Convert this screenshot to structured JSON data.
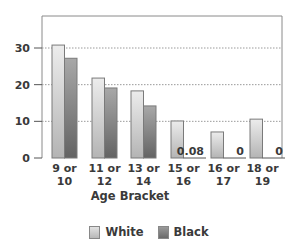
{
  "chart_data": {
    "type": "bar",
    "title": "",
    "xlabel": "Age Bracket",
    "ylabel": "",
    "ylim": [
      0,
      35
    ],
    "yticks": [
      0,
      10,
      20,
      30
    ],
    "grid": "horizontal dotted at 10, 20, 30",
    "legend_position": "bottom",
    "categories": [
      [
        "9 or",
        "10"
      ],
      [
        "11 or",
        "12"
      ],
      [
        "13 or",
        "14"
      ],
      [
        "15 or",
        "16"
      ],
      [
        "16 or",
        "17"
      ],
      [
        "18 or",
        "19"
      ]
    ],
    "series": [
      {
        "name": "White",
        "color": "#cfcfcf",
        "values": [
          30.8,
          21.8,
          18.3,
          10.1,
          7.1,
          10.6
        ]
      },
      {
        "name": "Black",
        "color": "#7d7d7d",
        "values": [
          27.2,
          19.1,
          14.2,
          0.08,
          0,
          0
        ]
      }
    ],
    "annotations": [
      "0.08",
      "0",
      "0"
    ]
  },
  "legend": {
    "white_label": "White",
    "black_label": "Black"
  },
  "axis": {
    "x_title": "Age Bracket"
  }
}
